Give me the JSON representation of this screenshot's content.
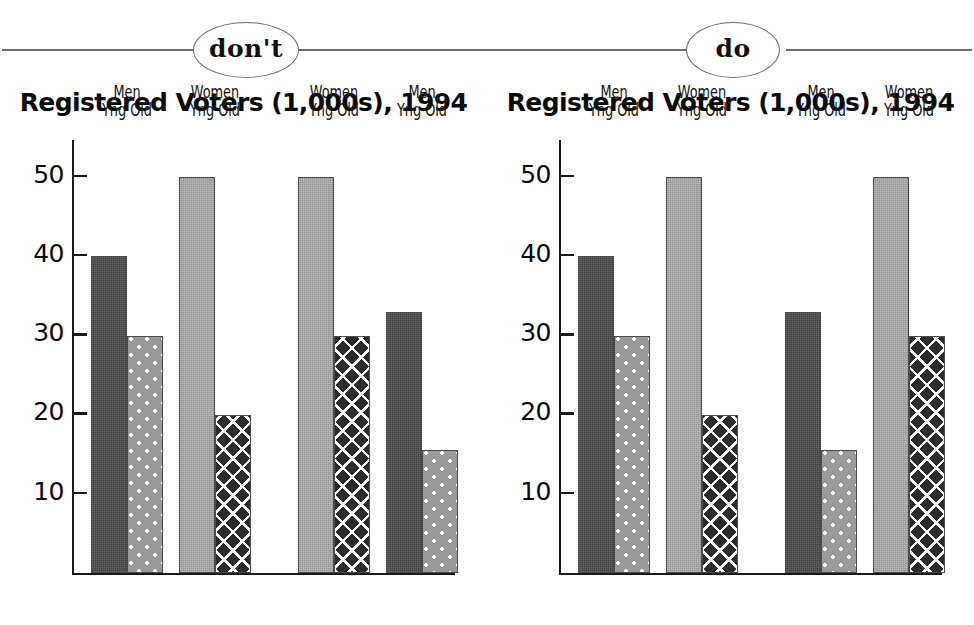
{
  "banner": {
    "dont_label": "don't",
    "do_label": "do"
  },
  "charts": [
    {
      "id": "dont",
      "title": "Registered Voters (1,000s), 1994",
      "groups": [
        {
          "category": "Raintree Co.",
          "clusters": [
            {
              "gender": "Men",
              "ages": "Yng Old",
              "bars": [
                {
                  "age": "Yng",
                  "value": 40,
                  "pattern": "dark-solid"
                },
                {
                  "age": "Old",
                  "value": 30,
                  "pattern": "dot"
                }
              ]
            },
            {
              "gender": "Women",
              "ages": "Yng Old",
              "bars": [
                {
                  "age": "Yng",
                  "value": 50,
                  "pattern": "light-solid"
                },
                {
                  "age": "Old",
                  "value": 20,
                  "pattern": "cross"
                }
              ]
            }
          ]
        },
        {
          "category": "Paris Co.",
          "clusters": [
            {
              "gender": "Women",
              "ages": "Yng Old",
              "bars": [
                {
                  "age": "Yng",
                  "value": 50,
                  "pattern": "light-solid"
                },
                {
                  "age": "Old",
                  "value": 30,
                  "pattern": "cross"
                }
              ]
            },
            {
              "gender": "Men",
              "ages": "Yng Old",
              "bars": [
                {
                  "age": "Yng",
                  "value": 33,
                  "pattern": "dark-solid"
                },
                {
                  "age": "Old",
                  "value": 15.5,
                  "pattern": "dot"
                }
              ]
            }
          ]
        }
      ]
    },
    {
      "id": "do",
      "title": "Registered Voters (1,000s), 1994",
      "groups": [
        {
          "category": "Raintree Co.",
          "clusters": [
            {
              "gender": "Men",
              "ages": "Yng Old",
              "bars": [
                {
                  "age": "Yng",
                  "value": 40,
                  "pattern": "dark-solid"
                },
                {
                  "age": "Old",
                  "value": 30,
                  "pattern": "dot"
                }
              ]
            },
            {
              "gender": "Women",
              "ages": "Yng Old",
              "bars": [
                {
                  "age": "Yng",
                  "value": 50,
                  "pattern": "light-solid"
                },
                {
                  "age": "Old",
                  "value": 20,
                  "pattern": "cross"
                }
              ]
            }
          ]
        },
        {
          "category": "Paris Co.",
          "clusters": [
            {
              "gender": "Men",
              "ages": "Yng Old",
              "bars": [
                {
                  "age": "Yng",
                  "value": 33,
                  "pattern": "dark-solid"
                },
                {
                  "age": "Old",
                  "value": 15.5,
                  "pattern": "dot"
                }
              ]
            },
            {
              "gender": "Women",
              "ages": "Yng Old",
              "bars": [
                {
                  "age": "Yng",
                  "value": 50,
                  "pattern": "light-solid"
                },
                {
                  "age": "Old",
                  "value": 30,
                  "pattern": "cross"
                }
              ]
            }
          ]
        }
      ]
    }
  ],
  "axis": {
    "ticks": [
      10,
      20,
      30,
      40,
      50
    ],
    "tick_labels": [
      "10",
      "20",
      "30",
      "40",
      "50"
    ],
    "ymin": 0,
    "ymax": 55
  },
  "colors": {
    "dark_solid": "#4a4a4a",
    "dot_fill": "#9a9a9a",
    "light_solid": "#a8a8a8",
    "cross_fill": "#2c2c2c",
    "rule": "#6e6e6e",
    "text": "#0a0a0a"
  },
  "chart_data": {
    "type": "bar",
    "title": "Registered Voters (1,000s), 1994",
    "xlabel": "",
    "ylabel": "",
    "ylim": [
      0,
      55
    ],
    "yticks": [
      10,
      20,
      30,
      40,
      50
    ],
    "grid": false,
    "legend": "none",
    "note": "Two side-by-side panels labelled don't (left) and do (right). Same data; the don't panel mirrors the Men/Women cluster order within Paris Co., the do panel keeps Men then Women consistent across both counties.",
    "categories": [
      "Raintree Co.",
      "Paris Co."
    ],
    "panels": [
      {
        "name": "don't",
        "cluster_order": [
          [
            "Men",
            "Women"
          ],
          [
            "Women",
            "Men"
          ]
        ],
        "series": [
          {
            "name": "Raintree Co. / Men Yng",
            "value": 40
          },
          {
            "name": "Raintree Co. / Men Old",
            "value": 30
          },
          {
            "name": "Raintree Co. / Women Yng",
            "value": 50
          },
          {
            "name": "Raintree Co. / Women Old",
            "value": 20
          },
          {
            "name": "Paris Co. / Women Yng",
            "value": 50
          },
          {
            "name": "Paris Co. / Women Old",
            "value": 30
          },
          {
            "name": "Paris Co. / Men Yng",
            "value": 33
          },
          {
            "name": "Paris Co. / Men Old",
            "value": 15.5
          }
        ]
      },
      {
        "name": "do",
        "cluster_order": [
          [
            "Men",
            "Women"
          ],
          [
            "Men",
            "Women"
          ]
        ],
        "series": [
          {
            "name": "Raintree Co. / Men Yng",
            "value": 40
          },
          {
            "name": "Raintree Co. / Men Old",
            "value": 30
          },
          {
            "name": "Raintree Co. / Women Yng",
            "value": 50
          },
          {
            "name": "Raintree Co. / Women Old",
            "value": 20
          },
          {
            "name": "Paris Co. / Men Yng",
            "value": 33
          },
          {
            "name": "Paris Co. / Men Old",
            "value": 15.5
          },
          {
            "name": "Paris Co. / Women Yng",
            "value": 50
          },
          {
            "name": "Paris Co. / Women Old",
            "value": 30
          }
        ]
      }
    ]
  }
}
